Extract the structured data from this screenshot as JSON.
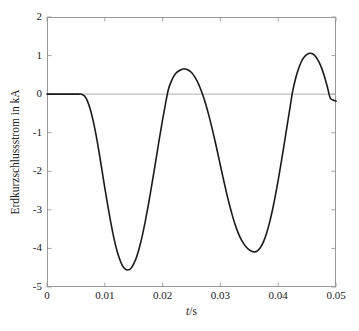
{
  "chart_data": {
    "type": "line",
    "title": "",
    "subtitle": "",
    "xlabel": "t/s",
    "xlabel_italic_part": "t",
    "xlabel_rest": "/s",
    "ylabel": "Erdkurzschlussstrom in kA",
    "xlim": [
      0,
      0.05
    ],
    "ylim": [
      -5,
      2
    ],
    "xticks": [
      0,
      0.01,
      0.02,
      0.03,
      0.04,
      0.05
    ],
    "xtick_labels": [
      "0",
      "0.01",
      "0.02",
      "0.03",
      "0.04",
      "0.05"
    ],
    "yticks": [
      2,
      1,
      0,
      -1,
      -2,
      -3,
      -4,
      -5
    ],
    "ytick_labels": [
      "2",
      "1",
      "0",
      "-1",
      "-2",
      "-3",
      "-4",
      "-5"
    ],
    "grid": false,
    "legend": null,
    "zero_line": true,
    "line_color": "#1a1a1a",
    "axis_color": "#9a9a9a",
    "series": [
      {
        "name": "Erdkurzschlussstrom",
        "color": "#1a1a1a",
        "x": [
          0.0,
          0.0005,
          0.001,
          0.0015,
          0.002,
          0.0025,
          0.003,
          0.0035,
          0.004,
          0.0045,
          0.005,
          0.0055,
          0.006,
          0.0065,
          0.007,
          0.0075,
          0.008,
          0.0085,
          0.009,
          0.0095,
          0.01,
          0.0105,
          0.011,
          0.0115,
          0.012,
          0.0125,
          0.013,
          0.0135,
          0.014,
          0.0145,
          0.015,
          0.0155,
          0.016,
          0.0165,
          0.017,
          0.0175,
          0.018,
          0.0185,
          0.019,
          0.0195,
          0.02,
          0.0205,
          0.021,
          0.0215,
          0.022,
          0.0225,
          0.023,
          0.0235,
          0.024,
          0.0245,
          0.025,
          0.0255,
          0.026,
          0.0265,
          0.027,
          0.0275,
          0.028,
          0.0285,
          0.029,
          0.0295,
          0.03,
          0.0305,
          0.031,
          0.0315,
          0.032,
          0.0325,
          0.033,
          0.0335,
          0.034,
          0.0345,
          0.035,
          0.0355,
          0.036,
          0.0365,
          0.037,
          0.0375,
          0.038,
          0.0385,
          0.039,
          0.0395,
          0.04,
          0.0405,
          0.041,
          0.0415,
          0.042,
          0.0425,
          0.043,
          0.0435,
          0.044,
          0.0445,
          0.045,
          0.0455,
          0.046,
          0.0465,
          0.047,
          0.0475,
          0.048,
          0.0485,
          0.049,
          0.0495,
          0.05
        ],
        "y": [
          0.0,
          0.0,
          0.0,
          0.0,
          0.0,
          0.0,
          0.0,
          0.0,
          0.0,
          0.0,
          0.0,
          0.0,
          0.0,
          -0.05,
          -0.18,
          -0.4,
          -0.7,
          -1.07,
          -1.5,
          -1.96,
          -2.43,
          -2.88,
          -3.3,
          -3.68,
          -4.0,
          -4.25,
          -4.43,
          -4.53,
          -4.56,
          -4.52,
          -4.4,
          -4.22,
          -3.97,
          -3.66,
          -3.3,
          -2.9,
          -2.47,
          -2.02,
          -1.56,
          -1.1,
          -0.66,
          -0.25,
          0.12,
          0.33,
          0.48,
          0.57,
          0.62,
          0.65,
          0.65,
          0.62,
          0.56,
          0.46,
          0.33,
          0.16,
          -0.04,
          -0.28,
          -0.55,
          -0.85,
          -1.17,
          -1.5,
          -1.85,
          -2.19,
          -2.52,
          -2.83,
          -3.11,
          -3.36,
          -3.57,
          -3.74,
          -3.87,
          -3.97,
          -4.04,
          -4.08,
          -4.09,
          -4.05,
          -3.96,
          -3.81,
          -3.6,
          -3.33,
          -3.01,
          -2.64,
          -2.23,
          -1.79,
          -1.33,
          -0.86,
          -0.39,
          0.07,
          0.4,
          0.65,
          0.84,
          0.96,
          1.03,
          1.06,
          1.04,
          0.97,
          0.85,
          0.68,
          0.46,
          0.19,
          -0.1,
          -0.15,
          -0.18
        ]
      }
    ],
    "annotations": [
      {
        "label": "flat at zero until",
        "x": 0.006,
        "y": 0
      },
      {
        "label": "first minimum",
        "x": 0.0145,
        "y": -4.56
      },
      {
        "label": "first positive peak",
        "x": 0.0238,
        "y": 0.65
      },
      {
        "label": "second minimum",
        "x": 0.036,
        "y": -4.09
      },
      {
        "label": "second positive peak",
        "x": 0.0465,
        "y": 1.06
      }
    ]
  }
}
